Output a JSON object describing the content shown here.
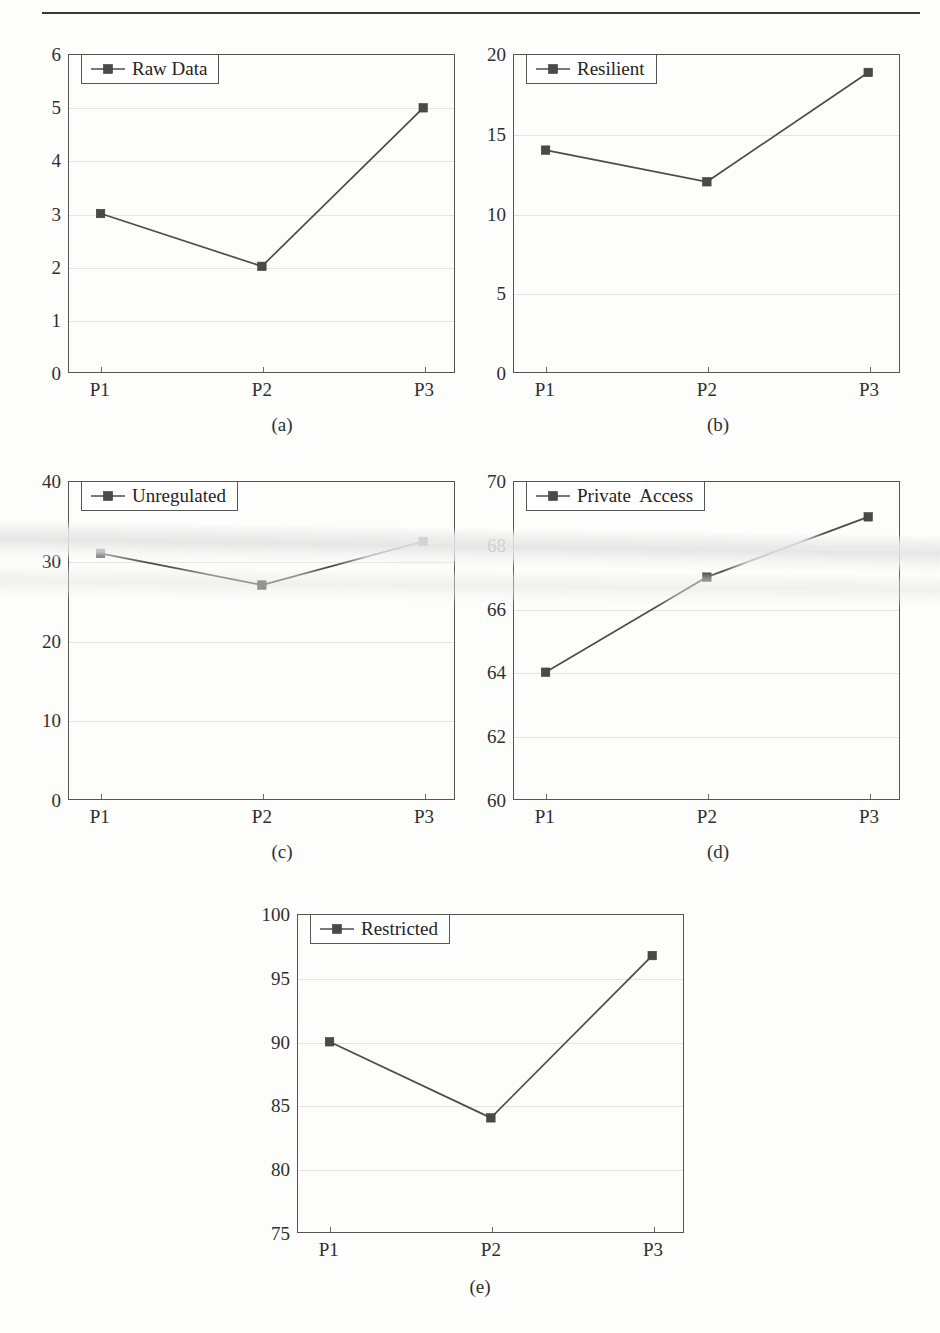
{
  "page": {
    "top_rule_present": true,
    "cut_header_text": "",
    "background_color": "#fdfdfc",
    "line_color": "#4c4c4c",
    "marker_color": "#4a4a4a",
    "grid_color": "#e4e4e4",
    "axis_color": "#555555"
  },
  "chart_data": [
    {
      "id": "a",
      "type": "line",
      "title": "",
      "caption": "(a)",
      "legend": [
        "Raw Data"
      ],
      "legend_position": "upper-left",
      "grid": true,
      "xlabel": "",
      "ylabel": "",
      "categories": [
        "P1",
        "P2",
        "P3"
      ],
      "series": [
        {
          "name": "Raw Data",
          "values": [
            3,
            2,
            5
          ]
        }
      ],
      "yticks": [
        0,
        1,
        2,
        3,
        4,
        5,
        6
      ],
      "ylim": [
        0,
        6
      ]
    },
    {
      "id": "b",
      "type": "line",
      "title": "",
      "caption": "(b)",
      "legend": [
        "Resilient"
      ],
      "legend_position": "upper-left",
      "grid": true,
      "xlabel": "",
      "ylabel": "",
      "categories": [
        "P1",
        "P2",
        "P3"
      ],
      "series": [
        {
          "name": "Resilient",
          "values": [
            14,
            12,
            18.9
          ]
        }
      ],
      "yticks": [
        0,
        5,
        10,
        15,
        20
      ],
      "ylim": [
        0,
        20
      ]
    },
    {
      "id": "c",
      "type": "line",
      "title": "",
      "caption": "(c)",
      "legend": [
        "Unregulated"
      ],
      "legend_position": "upper-left",
      "grid": true,
      "xlabel": "",
      "ylabel": "",
      "categories": [
        "P1",
        "P2",
        "P3"
      ],
      "series": [
        {
          "name": "Unregulated",
          "values": [
            31,
            27,
            32.5
          ]
        }
      ],
      "yticks": [
        0,
        10,
        20,
        30,
        40
      ],
      "ylim": [
        0,
        40
      ]
    },
    {
      "id": "d",
      "type": "line",
      "title": "",
      "caption": "(d)",
      "legend": [
        "Private  Access"
      ],
      "legend_position": "upper-left",
      "grid": true,
      "xlabel": "",
      "ylabel": "",
      "categories": [
        "P1",
        "P2",
        "P3"
      ],
      "series": [
        {
          "name": "Private  Access",
          "values": [
            64,
            67,
            68.9
          ]
        }
      ],
      "yticks": [
        60,
        62,
        64,
        66,
        68,
        70
      ],
      "ylim": [
        60,
        70
      ]
    },
    {
      "id": "e",
      "type": "line",
      "title": "",
      "caption": "(e)",
      "legend": [
        "Restricted"
      ],
      "legend_position": "upper-left",
      "grid": true,
      "xlabel": "",
      "ylabel": "",
      "categories": [
        "P1",
        "P2",
        "P3"
      ],
      "series": [
        {
          "name": "Restricted",
          "values": [
            90,
            84,
            96.8
          ]
        }
      ],
      "yticks": [
        75,
        80,
        85,
        90,
        95,
        100
      ],
      "ylim": [
        75,
        100
      ]
    }
  ],
  "layout": {
    "panels": [
      {
        "id": "a",
        "left": 68,
        "top": 54,
        "width": 387,
        "height": 319,
        "caption_x": 282,
        "caption_y": 414
      },
      {
        "id": "b",
        "left": 513,
        "top": 54,
        "width": 387,
        "height": 319,
        "caption_x": 718,
        "caption_y": 414
      },
      {
        "id": "c",
        "left": 68,
        "top": 481,
        "width": 387,
        "height": 319,
        "caption_x": 282,
        "caption_y": 841
      },
      {
        "id": "d",
        "left": 513,
        "top": 481,
        "width": 387,
        "height": 319,
        "caption_x": 718,
        "caption_y": 841
      },
      {
        "id": "e",
        "left": 297,
        "top": 914,
        "width": 387,
        "height": 319,
        "caption_x": 480,
        "caption_y": 1276
      }
    ]
  }
}
